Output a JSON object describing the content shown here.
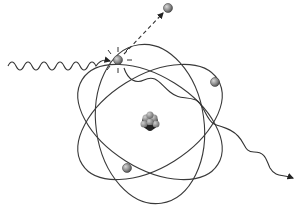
{
  "diagram": {
    "nucleus": {
      "label": "nucleus",
      "cx": 150,
      "cy": 122
    },
    "orbits": [
      {
        "name": "orbit-1",
        "cx": 150,
        "cy": 122,
        "rx": 78,
        "ry": 48,
        "rotate": -30
      },
      {
        "name": "orbit-2",
        "cx": 150,
        "cy": 122,
        "rx": 78,
        "ry": 48,
        "rotate": 30
      },
      {
        "name": "orbit-3",
        "cx": 150,
        "cy": 122,
        "rx": 48,
        "ry": 82,
        "rotate": 0
      }
    ],
    "electrons": [
      {
        "name": "excited-electron",
        "cx": 118,
        "cy": 60
      },
      {
        "name": "orbit-electron-right",
        "cx": 215,
        "cy": 82
      },
      {
        "name": "orbit-electron-lower",
        "cx": 127,
        "cy": 168
      },
      {
        "name": "ejected-electron",
        "cx": 168,
        "cy": 8
      }
    ],
    "incoming_photon": {
      "label": "incoming photon"
    },
    "outgoing_photon": {
      "label": "emitted photon"
    },
    "ejected_path": {
      "label": "ejected electron path"
    },
    "colors": {
      "line": "#333333",
      "electron": "#8a8a8a",
      "nucleus_dark": "#1a1a1a",
      "nucleus_light": "#9a9a9a"
    }
  }
}
